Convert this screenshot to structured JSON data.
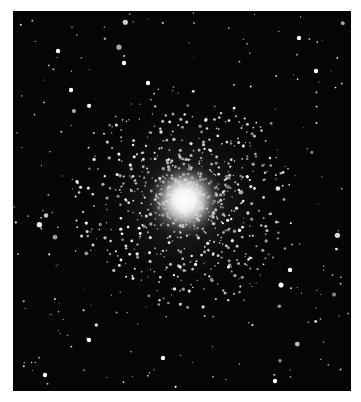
{
  "image": {
    "subject": "globular star cluster photograph",
    "background_color": "#050505",
    "page_color": "#ffffff",
    "cluster_center": [
      172,
      189
    ],
    "core_radius": 28,
    "halo_radius": 110
  }
}
